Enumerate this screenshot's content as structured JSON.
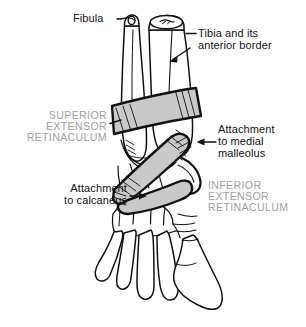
{
  "figure": {
    "background_color": "#ffffff",
    "line_color": "#111111",
    "band_fill_color": "#c9c9c9",
    "caps_label_color": "#a0a0a0"
  },
  "labels": {
    "fibula": "Fibula",
    "tibia_line1": "Tibia and its",
    "tibia_line2": "anterior border",
    "superior_line1": "SUPERIOR",
    "superior_line2": "EXTENSOR",
    "superior_line3": "RETINACULUM",
    "medial_malleolus_line1": "Attachment",
    "medial_malleolus_line2": "to medial",
    "medial_malleolus_line3": "malleolus",
    "calcaneus_line1": "Attachment",
    "calcaneus_line2": "to calcaneus",
    "inferior_line1": "INFERIOR",
    "inferior_line2": "EXTENSOR",
    "inferior_line3": "RETINACULUM"
  },
  "structures": [
    {
      "name": "fibula",
      "kind": "bone"
    },
    {
      "name": "tibia",
      "kind": "bone"
    },
    {
      "name": "superior-extensor-retinaculum",
      "kind": "ligament-band"
    },
    {
      "name": "inferior-extensor-retinaculum",
      "kind": "ligament-band"
    },
    {
      "name": "talus",
      "kind": "bone"
    },
    {
      "name": "calcaneus",
      "kind": "bone"
    },
    {
      "name": "tarsal-bones",
      "kind": "bone-group"
    },
    {
      "name": "metatarsal-bones",
      "kind": "bone-group"
    }
  ]
}
